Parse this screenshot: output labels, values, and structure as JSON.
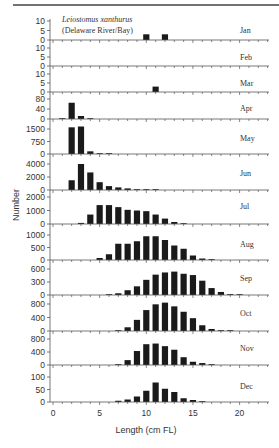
{
  "figure": {
    "species": "Leiostomus xanthurus",
    "location": "(Delaware River/Bay)",
    "xlabel": "Length (cm FL)",
    "ylabel": "Number",
    "bar_color": "#1a1a1a",
    "axis_color": "#555555"
  },
  "chart_data": {
    "type": "bar",
    "title": "Leiostomus xanthurus (Delaware River/Bay)",
    "xlabel": "Length (cm FL)",
    "ylabel": "Number",
    "xlim": [
      0,
      23
    ],
    "xticks": [
      0,
      5,
      10,
      15,
      20
    ],
    "grid": false,
    "legend": null,
    "layout": "12 stacked monthly panels sharing x-axis",
    "panels": [
      {
        "month": "Jan",
        "yticks": [
          0,
          5,
          10
        ],
        "ylim": [
          0,
          10
        ],
        "bins": [
          10,
          12
        ],
        "values": [
          3,
          3
        ]
      },
      {
        "month": "Feb",
        "yticks": [
          0,
          5,
          10
        ],
        "ylim": [
          0,
          10
        ],
        "bins": [],
        "values": []
      },
      {
        "month": "Mar",
        "yticks": [
          0,
          5,
          10
        ],
        "ylim": [
          0,
          10
        ],
        "bins": [
          11
        ],
        "values": [
          3
        ]
      },
      {
        "month": "Apr",
        "yticks": [
          0,
          40,
          80
        ],
        "ylim": [
          0,
          85
        ],
        "bins": [
          1,
          2,
          3,
          4
        ],
        "values": [
          2,
          65,
          12,
          2
        ]
      },
      {
        "month": "May",
        "yticks": [
          0,
          750,
          1500
        ],
        "ylim": [
          0,
          1900
        ],
        "bins": [
          2,
          3,
          4,
          5,
          6
        ],
        "values": [
          1600,
          1650,
          160,
          40,
          30
        ]
      },
      {
        "month": "Jun",
        "yticks": [
          0,
          2000,
          4000
        ],
        "ylim": [
          0,
          4300
        ],
        "bins": [
          2,
          3,
          4,
          5,
          6,
          7,
          8,
          9,
          10,
          11
        ],
        "values": [
          1500,
          4000,
          2700,
          1200,
          600,
          400,
          250,
          100,
          40,
          20
        ]
      },
      {
        "month": "Jul",
        "yticks": [
          0,
          1000,
          2000
        ],
        "ylim": [
          0,
          2200
        ],
        "bins": [
          3,
          4,
          5,
          6,
          7,
          8,
          9,
          10,
          11,
          12,
          13,
          14
        ],
        "values": [
          80,
          700,
          1400,
          1400,
          1250,
          1050,
          1000,
          950,
          700,
          400,
          150,
          30
        ]
      },
      {
        "month": "Aug",
        "yticks": [
          0,
          500,
          1000
        ],
        "ylim": [
          0,
          1150
        ],
        "bins": [
          5,
          6,
          7,
          8,
          9,
          10,
          11,
          12,
          13,
          14,
          15,
          16,
          17
        ],
        "values": [
          80,
          230,
          650,
          650,
          750,
          950,
          950,
          800,
          580,
          450,
          180,
          60,
          15
        ]
      },
      {
        "month": "Sep",
        "yticks": [
          0,
          300,
          600
        ],
        "ylim": [
          0,
          680
        ],
        "bins": [
          6,
          7,
          8,
          9,
          10,
          11,
          12,
          13,
          14,
          15,
          16,
          17,
          18,
          19,
          20
        ],
        "values": [
          15,
          40,
          110,
          200,
          350,
          470,
          520,
          540,
          490,
          460,
          330,
          160,
          70,
          20,
          10
        ]
      },
      {
        "month": "Oct",
        "yticks": [
          0,
          400,
          800
        ],
        "ylim": [
          0,
          920
        ],
        "bins": [
          7,
          8,
          9,
          10,
          11,
          12,
          13,
          14,
          15,
          16,
          17,
          18,
          19
        ],
        "values": [
          20,
          110,
          330,
          620,
          790,
          840,
          730,
          570,
          380,
          170,
          60,
          15,
          10
        ]
      },
      {
        "month": "Nov",
        "yticks": [
          0,
          400,
          800
        ],
        "ylim": [
          0,
          920
        ],
        "bins": [
          7,
          8,
          9,
          10,
          11,
          12,
          13,
          14,
          15,
          16,
          17
        ],
        "values": [
          15,
          150,
          430,
          640,
          660,
          580,
          470,
          240,
          100,
          60,
          20
        ]
      },
      {
        "month": "Dec",
        "yticks": [
          0,
          50,
          100
        ],
        "ylim": [
          0,
          115
        ],
        "bins": [
          7,
          8,
          9,
          10,
          11,
          12,
          13,
          14,
          15,
          16
        ],
        "values": [
          5,
          10,
          22,
          45,
          78,
          53,
          40,
          15,
          8,
          2
        ]
      }
    ]
  },
  "layout": {
    "panel_baselines": [
      40,
      66,
      92,
      119,
      154,
      190,
      224,
      260,
      295,
      331,
      365,
      402
    ],
    "panel_top_ticks": [
      21,
      48,
      74,
      99,
      129,
      164,
      197,
      235,
      269,
      304,
      339,
      377
    ]
  }
}
